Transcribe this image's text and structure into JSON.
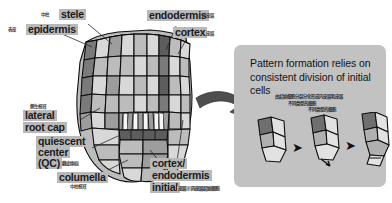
{
  "figure": {
    "title_visible": false,
    "background_color": "#ffffff",
    "label_box_color": "#b9b9b9",
    "panel_color": "#c2c2c2",
    "ink_color": "#1b1b1b"
  },
  "root_labels": [
    {
      "id": "stele",
      "en": "stele",
      "cn": "中柱"
    },
    {
      "id": "epidermis",
      "en": "epidermis",
      "cn": "表皮"
    },
    {
      "id": "endodermis",
      "en": "endodermis",
      "cn": "内皮层"
    },
    {
      "id": "cortex",
      "en": "cortex",
      "cn": "皮层"
    },
    {
      "id": "lateral-root-cap",
      "en": "lateral root cap",
      "cn": "侧生根冠"
    },
    {
      "id": "quiescent-center",
      "en": "quiescent center (QC)",
      "cn": "静止中心"
    },
    {
      "id": "columella",
      "en": "columella",
      "cn": "中柱根冠"
    },
    {
      "id": "cortex-endodermis-initial",
      "en": "cortex/ endodermis initial",
      "cn": "皮层/内皮层起始细胞"
    }
  ],
  "labels": {
    "stele": {
      "en": "stele",
      "cn": "中柱"
    },
    "epidermis": {
      "en": "epidermis",
      "cn": "表皮"
    },
    "endodermis": {
      "en": "endodermis",
      "cn": "内皮层"
    },
    "cortex": {
      "en": "cortex",
      "cn": "皮层"
    },
    "lateral_root_cap": {
      "en_line1": "lateral",
      "en_line2": "root cap",
      "cn": "侧生根冠"
    },
    "quiescent_center": {
      "en_line1": "quiescent",
      "en_line2": "center",
      "en_line3": "(QC)",
      "cn": "静止中心"
    },
    "columella": {
      "en": "columella",
      "cn": "中柱根冠"
    },
    "cortex_endodermis_initial": {
      "en_line1": "cortex/",
      "en_line2": "endodermis",
      "en_line3": "initial",
      "cn": "皮层 / 内皮层起始细胞"
    }
  },
  "panel": {
    "title": "Pattern formation relies on consistent division of initial cells",
    "title_line1": "Pattern formation relies on",
    "title_line2": "consistent division of initial",
    "title_line3": "cells",
    "cn_line1": "由起始细胞分裂分化形成内皮层和皮层",
    "cn_line2": "不同类型的细胞",
    "diagram_caption": "不同类型的细胞",
    "stages": [
      {
        "id": "stage-1",
        "name": "initial cell before division"
      },
      {
        "id": "stage-2",
        "name": "anticlinal division"
      },
      {
        "id": "stage-3",
        "name": "periclinal division producing cortex and endodermis"
      }
    ],
    "arrow_glyph": "▶"
  },
  "connector_arrow": {
    "name": "big-curved-arrow",
    "direction": "right"
  }
}
